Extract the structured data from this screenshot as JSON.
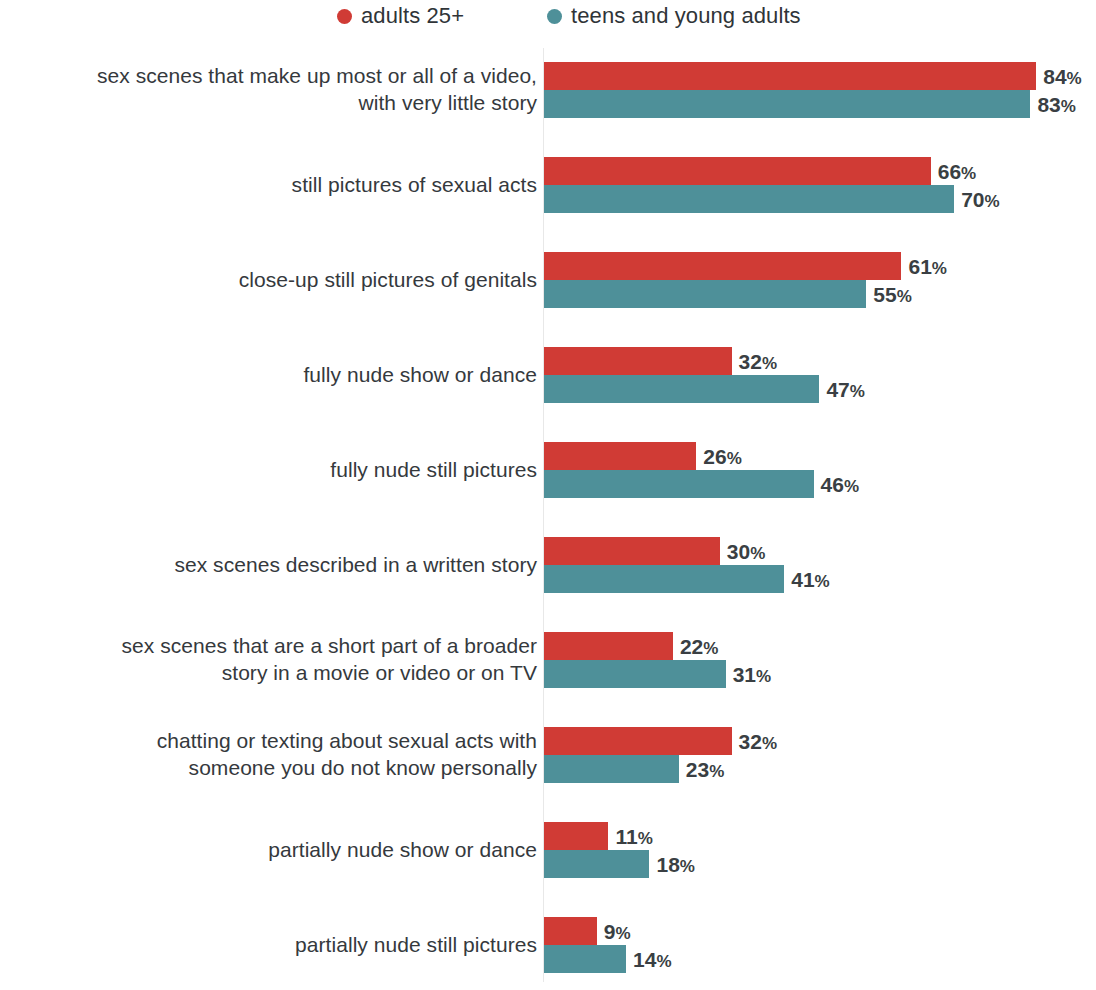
{
  "legend": {
    "items": [
      {
        "label": "adults 25+",
        "color": "#d03b35",
        "marker": "circle-marker"
      },
      {
        "label": "teens and young adults",
        "color": "#4e9099",
        "marker": "circle-marker"
      }
    ]
  },
  "chart_data": {
    "type": "bar",
    "orientation": "horizontal",
    "title": "",
    "subtitle": "",
    "xlabel": "",
    "ylabel": "",
    "xlim": [
      0,
      100
    ],
    "grid": false,
    "value_suffix": "%",
    "legend_position": "top",
    "colors": {
      "adults": "#d03b35",
      "teens": "#4e9099",
      "axis_line": "#e8e8e8",
      "label_text": "#35393d",
      "value_text": "#3a3f43"
    },
    "categories": [
      "sex scenes that make up most or all of a video,\nwith very little story",
      "still pictures of sexual acts",
      "close-up still pictures of genitals",
      "fully nude show or dance",
      "fully nude still pictures",
      "sex scenes described in a written story",
      "sex scenes that are a short part of a broader\nstory in a movie or video or on TV",
      "chatting or texting about sexual acts with\nsomeone you do not know personally",
      "partially nude show or dance",
      "partially nude still pictures"
    ],
    "series": [
      {
        "name": "adults 25+",
        "color": "#d03b35",
        "values": [
          84,
          66,
          61,
          32,
          26,
          30,
          22,
          32,
          11,
          9
        ],
        "labels": [
          "84%",
          "66%",
          "61%",
          "32%",
          "26%",
          "30%",
          "22%",
          "32%",
          "11%",
          "9%"
        ]
      },
      {
        "name": "teens and young adults",
        "color": "#4e9099",
        "values": [
          83,
          70,
          55,
          47,
          46,
          41,
          31,
          23,
          18,
          14
        ],
        "labels": [
          "83%",
          "70%",
          "55%",
          "47%",
          "46%",
          "41%",
          "31%",
          "23%",
          "18%",
          "14%"
        ]
      }
    ]
  }
}
